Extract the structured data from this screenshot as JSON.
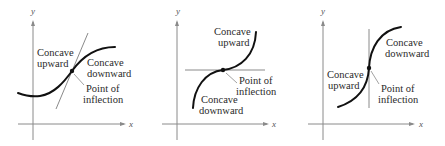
{
  "figure": {
    "panels": [
      {
        "id": "panel-1",
        "axes": {
          "x_label": "x",
          "y_label": "y"
        },
        "tangent": "oblique",
        "labels": {
          "upper_left_1": "Concave",
          "upper_left_2": "upward",
          "right_1": "Concave",
          "right_2": "downward",
          "point_1": "Point of",
          "point_2": "inflection"
        }
      },
      {
        "id": "panel-2",
        "axes": {
          "x_label": "x",
          "y_label": "y"
        },
        "tangent": "horizontal",
        "labels": {
          "top_1": "Concave",
          "top_2": "upward",
          "bottom_1": "Concave",
          "bottom_2": "downward",
          "point_1": "Point of",
          "point_2": "inflection"
        }
      },
      {
        "id": "panel-3",
        "axes": {
          "x_label": "x",
          "y_label": "y"
        },
        "tangent": "vertical",
        "labels": {
          "right_1": "Concave",
          "right_2": "downward",
          "left_1": "Concave",
          "left_2": "upward",
          "point_1": "Point of",
          "point_2": "inflection"
        }
      }
    ]
  }
}
